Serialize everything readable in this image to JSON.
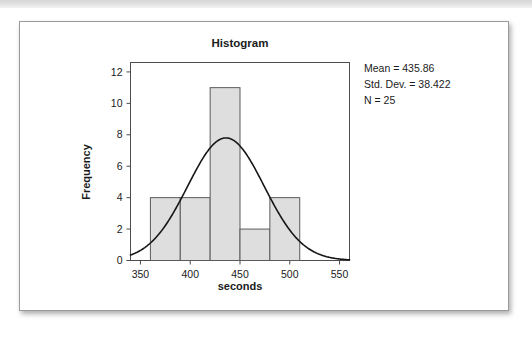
{
  "card": {
    "background_color": "#ffffff",
    "border_color": "#9a9a9a"
  },
  "stats": {
    "mean_label": "Mean = 435.86",
    "std_dev_label": "Std. Dev. = 38.422",
    "n_label": "N = 25"
  },
  "chart_data": {
    "type": "bar",
    "title": "Histogram",
    "xlabel": "seconds",
    "ylabel": "Frequency",
    "bin_width": 30,
    "bin_edges": [
      360,
      390,
      420,
      450,
      480,
      510
    ],
    "categories": [
      "360-390",
      "390-420",
      "420-450",
      "450-480",
      "480-510"
    ],
    "values": [
      4,
      4,
      11,
      2,
      4
    ],
    "bar_fill_color": "#dedede",
    "bar_edge_color": "#5a5a5a",
    "xlim": [
      340,
      560
    ],
    "ylim": [
      0,
      12.6
    ],
    "xticks": [
      350,
      400,
      450,
      500,
      550
    ],
    "xtick_labels": [
      "350",
      "400",
      "450",
      "500",
      "550"
    ],
    "yticks": [
      0,
      2,
      4,
      6,
      8,
      10,
      12
    ],
    "ytick_labels": [
      "0",
      "2",
      "4",
      "6",
      "8",
      "10",
      "12"
    ],
    "grid": false,
    "legend": false,
    "overlay": {
      "type": "normal-curve",
      "mean": 435.86,
      "std_dev": 38.422,
      "n": 25,
      "peak_value": 7.8,
      "color": "#171717"
    },
    "annotations": [
      "Mean = 435.86",
      "Std. Dev. = 38.422",
      "N = 25"
    ]
  }
}
